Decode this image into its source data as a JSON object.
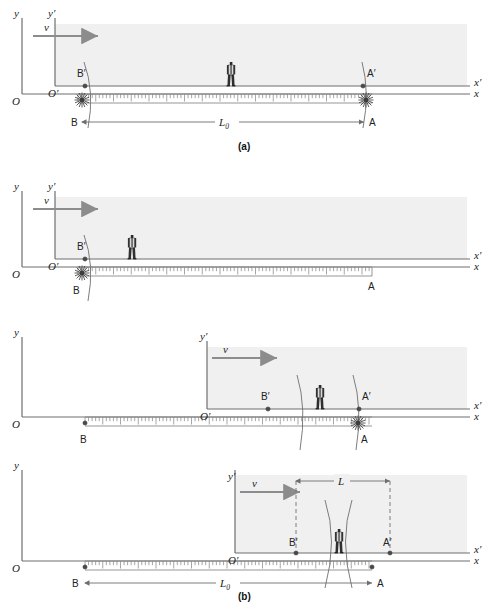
{
  "figure": {
    "colors": {
      "frame_fill": "#f0f0f0",
      "frame_stroke": "#9a9a9a",
      "axis": "#6e6e6e",
      "ruler": "#8a8a8a",
      "person_dark": "#2b2b2b",
      "person_light": "#d8d8d8",
      "burst": "#555555",
      "dim_line": "#7d7d7d",
      "dashed": "#6f6f6f",
      "text": "#1a1a1a"
    },
    "panel_tags": [
      {
        "id": "a",
        "label": "(a)",
        "x": 243,
        "y": 148
      },
      {
        "id": "b",
        "label": "(b)",
        "x": 243,
        "y": 597
      }
    ]
  },
  "panels": [
    {
      "id": "panel-a-top",
      "tag": "(a)",
      "axes": {
        "y_label": "y",
        "y_prime_label": "y′",
        "x_label": "x",
        "x_prime_label": "x′",
        "origin_label": "O",
        "origin_prime_label": "O′"
      },
      "velocity": {
        "label": "v",
        "direction": "right"
      },
      "points": [
        {
          "name": "B-prime",
          "label": "B′",
          "frame": "moving"
        },
        {
          "name": "A-prime",
          "label": "A′",
          "frame": "moving"
        },
        {
          "name": "B",
          "label": "B",
          "frame": "rest"
        },
        {
          "name": "A",
          "label": "A",
          "frame": "rest"
        }
      ],
      "bursts": [
        "B",
        "A"
      ],
      "dimension": {
        "label": "L",
        "subscript": "0",
        "from": "B",
        "to": "A"
      },
      "observer": {
        "present": true,
        "position": "center"
      }
    },
    {
      "id": "panel-a-bottom",
      "tag": "",
      "axes": {
        "y_label": "y",
        "y_prime_label": "y′",
        "x_label": "x",
        "x_prime_label": "x′",
        "origin_label": "O",
        "origin_prime_label": "O′"
      },
      "velocity": {
        "label": "v",
        "direction": "right"
      },
      "points": [
        {
          "name": "B-prime",
          "label": "B′",
          "frame": "moving"
        },
        {
          "name": "B",
          "label": "B",
          "frame": "rest"
        },
        {
          "name": "A",
          "label": "A",
          "frame": "rest"
        }
      ],
      "bursts": [
        "B"
      ],
      "dimension": null,
      "observer": {
        "present": true,
        "position": "left"
      }
    },
    {
      "id": "panel-b-top",
      "tag": "",
      "axes": {
        "y_label": "y",
        "y_prime_label": "y′",
        "x_label": "x",
        "x_prime_label": "x′",
        "origin_label": "O",
        "origin_prime_label": "O′"
      },
      "velocity": {
        "label": "v",
        "direction": "right"
      },
      "points": [
        {
          "name": "B-prime",
          "label": "B′",
          "frame": "moving"
        },
        {
          "name": "A-prime",
          "label": "A′",
          "frame": "moving"
        },
        {
          "name": "B",
          "label": "B",
          "frame": "rest"
        },
        {
          "name": "A",
          "label": "A",
          "frame": "rest"
        }
      ],
      "bursts": [
        "A"
      ],
      "dimension": null,
      "observer": {
        "present": true,
        "position": "center-right"
      }
    },
    {
      "id": "panel-b-bottom",
      "tag": "(b)",
      "axes": {
        "y_label": "y",
        "y_prime_label": "y′",
        "x_label": "x",
        "x_prime_label": "x′",
        "origin_label": "O",
        "origin_prime_label": "O′"
      },
      "velocity": {
        "label": "v",
        "direction": "right"
      },
      "points": [
        {
          "name": "B-prime",
          "label": "B′",
          "frame": "moving"
        },
        {
          "name": "A-prime",
          "label": "A′",
          "frame": "moving"
        },
        {
          "name": "B",
          "label": "B",
          "frame": "rest"
        },
        {
          "name": "A",
          "label": "A",
          "frame": "rest"
        }
      ],
      "bursts": [],
      "dimension_moving": {
        "label": "L",
        "subscript": "",
        "from": "B′",
        "to": "A′"
      },
      "dimension_rest": {
        "label": "L",
        "subscript": "0",
        "from": "B",
        "to": "A"
      },
      "observer": {
        "present": true,
        "position": "center"
      }
    }
  ],
  "labels": {
    "y": "y",
    "y_prime": "y′",
    "x": "x",
    "x_prime": "x′",
    "O": "O",
    "O_prime": "O′",
    "v": "v",
    "A": "A",
    "B": "B",
    "A_prime": "A′",
    "B_prime": "B′",
    "L": "L",
    "L0_base": "L",
    "L0_sub": "0",
    "tag_a": "(a)",
    "tag_b": "(b)"
  }
}
